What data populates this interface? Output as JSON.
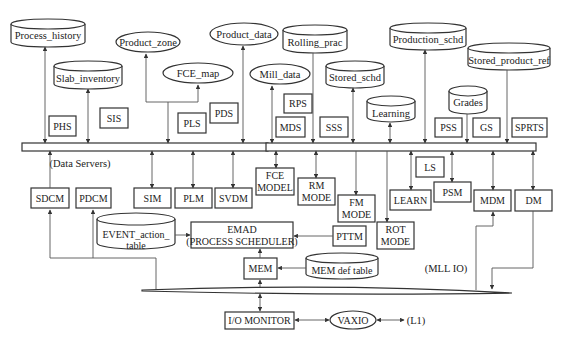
{
  "diagram": {
    "bus_label": "(Data Servers)",
    "mll_label": "(MLL IO)",
    "databases": {
      "process_history": "Process_history",
      "slab_inventory": "Slab_inventory",
      "rolling_prac": "Rolling_prac",
      "stored_schd": "Stored_schd",
      "learning": "Learning",
      "production_schd": "Production_schd",
      "grades": "Grades",
      "stored_product_ref": "Stored_product_ref",
      "event_action_table_1": "EVENT_action_",
      "event_action_table_2": "table",
      "mem_def_table": "MEM def table"
    },
    "ellipses": {
      "product_zone": "Product_zone",
      "fce_map": "FCE_map",
      "product_data": "Product_data",
      "mill_data": "Mill_data",
      "vaxio": "VAXIO"
    },
    "servers": {
      "phs": "PHS",
      "sis": "SIS",
      "pls": "PLS",
      "pds": "PDS",
      "rps": "RPS",
      "mds": "MDS",
      "sss": "SSS",
      "pss": "PSS",
      "gs": "GS",
      "sprts": "SPRTS"
    },
    "modules": {
      "sdcm": "SDCM",
      "pdcm": "PDCM",
      "sim": "SIM",
      "plm": "PLM",
      "svdm": "SVDM",
      "fce_model_1": "FCE",
      "fce_model_2": "MODEL",
      "rm_mode_1": "RM",
      "rm_mode_2": "MODE",
      "fm_mode_1": "FM",
      "fm_mode_2": "MODE",
      "rot_mode_1": "ROT",
      "rot_mode_2": "MODE",
      "ls": "LS",
      "learn": "LEARN",
      "psm": "PSM",
      "mdm": "MDM",
      "dm": "DM",
      "emad_1": "EMAD",
      "emad_2": "(PROCESS SCHEDULER)",
      "pttm": "PTTM",
      "mem": "MEM",
      "io_monitor": "I/O MONITOR",
      "l1": "(L1)"
    }
  }
}
